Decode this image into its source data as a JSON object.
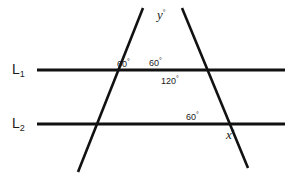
{
  "figure": {
    "background_color": "#ffffff",
    "stroke_color": "#111111",
    "text_color": "#1a1a1a"
  },
  "labels": {
    "line1": {
      "name": "L",
      "subscript": "1"
    },
    "line2": {
      "name": "L",
      "subscript": "2"
    },
    "angle_upper_left": {
      "value": "60",
      "degree": "°"
    },
    "angle_upper_right": {
      "value": "60",
      "degree": "°"
    },
    "angle_interior": {
      "value": "120",
      "degree": "°"
    },
    "angle_lower": {
      "value": "60",
      "degree": "°"
    },
    "unknown_top": {
      "value": "y",
      "degree": "°"
    },
    "unknown_bottom": {
      "value": "x",
      "degree": "°"
    }
  },
  "geometry": {
    "type": "line-diagram",
    "parallel_lines": [
      {
        "id": "L1",
        "x1": 37,
        "y1": 70,
        "x2": 285,
        "y2": 70
      },
      {
        "id": "L2",
        "x1": 37,
        "y1": 124,
        "x2": 285,
        "y2": 124
      }
    ],
    "transversals": [
      {
        "id": "left-transversal",
        "x1": 143,
        "y1": 8,
        "x2": 78,
        "y2": 172
      },
      {
        "id": "right-transversal",
        "x1": 182,
        "y1": 8,
        "x2": 248,
        "y2": 168
      }
    ],
    "apex": {
      "x": 162,
      "y": 39
    },
    "label_positions": {
      "line1": {
        "x": 12,
        "y": 62
      },
      "line2": {
        "x": 12,
        "y": 116
      },
      "angle_upper_left": {
        "x": 117,
        "y": 58
      },
      "angle_upper_right": {
        "x": 148,
        "y": 57
      },
      "angle_interior": {
        "x": 161,
        "y": 75
      },
      "angle_lower": {
        "x": 186,
        "y": 111
      },
      "unknown_top": {
        "x": 157,
        "y": 8
      },
      "unknown_bottom": {
        "x": 226,
        "y": 128
      }
    }
  }
}
